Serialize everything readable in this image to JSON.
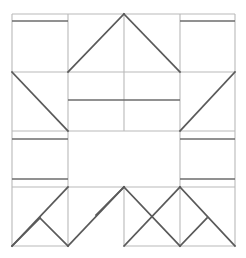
{
  "figure": {
    "canvas": {
      "width": 246,
      "height": 258,
      "background": "#ffffff"
    },
    "colors": {
      "grid": "#b9b9b9",
      "band": "#6d6d6d",
      "brace": "#5a5a5a"
    }
  },
  "chart_data": {
    "type": "diagram",
    "xlabel": "",
    "ylabel": "",
    "xlim": [
      0,
      246
    ],
    "ylim": [
      0,
      258
    ],
    "grid": true,
    "legend": "none",
    "grid_x": [
      12,
      68,
      124,
      180,
      235
    ],
    "grid_y": [
      14,
      72,
      131,
      187,
      246
    ],
    "series": [
      {
        "name": "grid",
        "type": "segments",
        "values": [
          [
            12,
            14,
            235,
            14
          ],
          [
            12,
            72,
            235,
            72
          ],
          [
            12,
            131,
            68,
            131
          ],
          [
            180,
            131,
            235,
            131
          ],
          [
            12,
            187,
            68,
            187
          ],
          [
            180,
            187,
            235,
            187
          ],
          [
            12,
            246,
            68,
            246
          ],
          [
            124,
            246,
            235,
            246
          ],
          [
            12,
            14,
            12,
            246
          ],
          [
            68,
            14,
            68,
            246
          ],
          [
            124,
            14,
            124,
            131
          ],
          [
            124,
            187,
            124,
            246
          ],
          [
            180,
            14,
            180,
            246
          ],
          [
            235,
            14,
            235,
            246
          ],
          [
            68,
            131,
            180,
            131
          ],
          [
            68,
            187,
            180,
            187
          ]
        ]
      },
      {
        "name": "bands",
        "type": "segments",
        "values": [
          [
            12,
            21,
            68,
            21
          ],
          [
            180,
            21,
            235,
            21
          ],
          [
            68,
            100,
            180,
            100
          ],
          [
            12,
            139,
            68,
            139
          ],
          [
            180,
            139,
            235,
            139
          ],
          [
            12,
            179,
            68,
            179
          ],
          [
            180,
            179,
            235,
            179
          ]
        ]
      },
      {
        "name": "braces",
        "type": "segments",
        "values": [
          [
            124,
            14,
            68,
            72
          ],
          [
            124,
            14,
            180,
            72
          ],
          [
            12,
            72,
            68,
            131
          ],
          [
            235,
            72,
            180,
            131
          ],
          [
            12,
            246,
            68,
            187
          ],
          [
            12,
            246,
            40,
            218
          ],
          [
            40,
            218,
            68,
            246
          ],
          [
            124,
            187,
            68,
            246
          ],
          [
            124,
            187,
            180,
            246
          ],
          [
            124,
            246,
            180,
            187
          ],
          [
            180,
            187,
            235,
            246
          ],
          [
            96,
            215,
            124,
            187
          ],
          [
            180,
            246,
            207,
            218
          ]
        ]
      }
    ]
  }
}
